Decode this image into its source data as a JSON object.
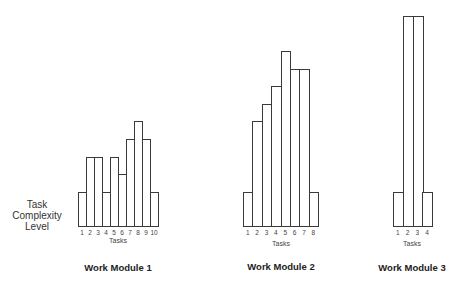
{
  "chart_data": [
    {
      "type": "bar",
      "title": "Work Module 1",
      "xlabel": "Tasks",
      "ylabel": "Task Complexity Level",
      "categories": [
        "1",
        "2",
        "3",
        "4",
        "5",
        "6",
        "7",
        "8",
        "9",
        "10"
      ],
      "values": [
        2,
        4,
        4,
        2,
        4,
        3,
        5,
        6,
        5,
        2
      ],
      "grid": false
    },
    {
      "type": "bar",
      "title": "Work Module 2",
      "xlabel": "Tasks",
      "ylabel": "",
      "categories": [
        "1",
        "2",
        "3",
        "4",
        "5",
        "6",
        "7",
        "8"
      ],
      "values": [
        2,
        6,
        7,
        8,
        10,
        9,
        9,
        2
      ],
      "grid": false
    },
    {
      "type": "bar",
      "title": "Work Module 3",
      "xlabel": "Tasks",
      "ylabel": "",
      "categories": [
        "1",
        "2",
        "3",
        "4"
      ],
      "values": [
        2,
        12,
        12,
        2
      ],
      "grid": false
    }
  ],
  "ylabel_lines": [
    "Task",
    "Complexity",
    "Level"
  ],
  "modules": [
    {
      "title": "Work Module 1",
      "xlabel": "Tasks"
    },
    {
      "title": "Work Module 2",
      "xlabel": "Tasks"
    },
    {
      "title": "Work Module 3",
      "xlabel": "Tasks"
    }
  ]
}
